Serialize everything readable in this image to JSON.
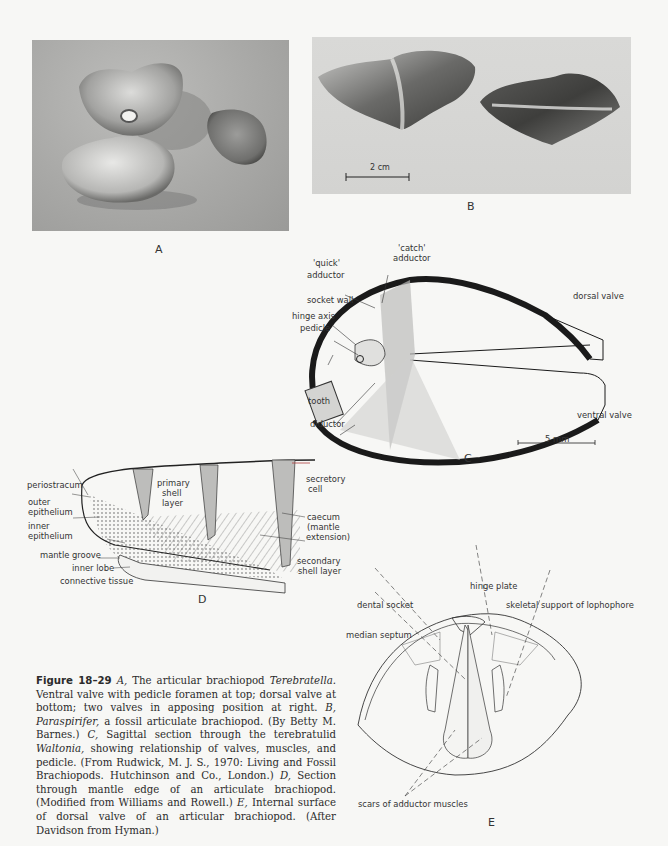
{
  "figure": {
    "number": "Figure 18–29",
    "panels": {
      "A": {
        "letter": "A",
        "type": "photograph",
        "subject": "Terebratella valves"
      },
      "B": {
        "letter": "B",
        "type": "photograph",
        "subject": "Paraspirifer fossils",
        "scale_bar": "2 cm"
      },
      "C": {
        "letter": "C",
        "type": "diagram",
        "labels": {
          "catch_adductor_1": "'catch'",
          "catch_adductor_2": "adductor",
          "quick_adductor_1": "'quick'",
          "quick_adductor_2": "adductor",
          "socket_wall": "socket wall",
          "hinge_axis": "hinge axis",
          "pedicle": "pedicle",
          "tooth": "tooth",
          "diductor": "diductor",
          "dorsal_valve": "dorsal valve",
          "ventral_valve": "ventral valve"
        },
        "scale_bar": "5 mm"
      },
      "D": {
        "letter": "D",
        "type": "diagram",
        "labels": {
          "periostracum": "periostracum",
          "outer_epithelium_1": "outer",
          "outer_epithelium_2": "epithelium",
          "inner_epithelium_1": "inner",
          "inner_epithelium_2": "epithelium",
          "mantle_groove": "mantle groove",
          "inner_lobe": "inner lobe",
          "connective_tissue": "connective tissue",
          "primary_1": "primary",
          "primary_2": "shell",
          "primary_3": "layer",
          "secretory_1": "secretory",
          "secretory_2": "cell",
          "caecum_1": "caecum",
          "caecum_2": "(mantle",
          "caecum_3": "extension)",
          "secondary_1": "secondary",
          "secondary_2": "shell layer"
        }
      },
      "E": {
        "letter": "E",
        "type": "diagram",
        "labels": {
          "hinge_plate": "hinge plate",
          "dental_socket": "dental socket",
          "skeletal_support": "skeletal support of lophophore",
          "median_septum": "median septum",
          "scars": "scars of adductor muscles"
        }
      }
    },
    "caption": {
      "lead": "Figure 18–29",
      "p1a": " A, ",
      "p1b": "The articular brachiopod ",
      "genus1": "Terebratella.",
      "p2": " Ventral valve with pedicle foramen at top; dorsal valve at bottom; two valves in apposing position at right. ",
      "B": "B, ",
      "genus2": "Paraspirifer,",
      "p3": " a fossil articulate brachiopod. (By Betty M. Barnes.) ",
      "C": "C, ",
      "p4": "Sagittal section through the terebratulid ",
      "genus3": "Waltonia,",
      "p5": " showing relationship of valves, muscles, and pedicle. (From Rudwick, M. J. S., 1970: Living and Fossil Brachiopods. Hutchinson and Co., London.) ",
      "D": "D, ",
      "p6": "Section through mantle edge of an articulate brachiopod. (Modified from Williams and Rowell.) ",
      "E": "E, ",
      "p7": "Internal surface of dorsal valve of an articular brachiopod. (After Davidson from Hyman.)"
    }
  }
}
